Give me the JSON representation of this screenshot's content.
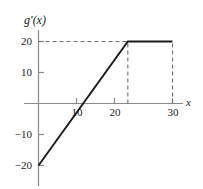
{
  "chart_data": {
    "type": "line",
    "title": "",
    "subtitle": "",
    "xlabel": "x",
    "ylabel": "g'(x)",
    "xlim": [
      0,
      33
    ],
    "ylim": [
      -22,
      22
    ],
    "grid": false,
    "legend": null,
    "x_ticks": [
      10,
      20,
      30
    ],
    "x_tick_labels": [
      "10",
      "20",
      "30"
    ],
    "y_ticks": [
      20,
      10,
      -10,
      -20
    ],
    "y_tick_labels": [
      "20",
      "10",
      "−10",
      "−20"
    ],
    "series": [
      {
        "name": "g'(x)",
        "style": "solid",
        "color": "#1a1a1a",
        "points": [
          {
            "x": 0,
            "y": -20
          },
          {
            "x": 20,
            "y": 20
          },
          {
            "x": 30,
            "y": 20
          }
        ]
      }
    ],
    "annotations": [
      {
        "kind": "dashed-horizontal",
        "y": 20,
        "x_from": 0,
        "x_to": 20
      },
      {
        "kind": "dashed-vertical",
        "x": 20,
        "y_from": 0,
        "y_to": 20
      },
      {
        "kind": "dashed-vertical",
        "x": 30,
        "y_from": 0,
        "y_to": 20
      }
    ],
    "zero_crossing": {
      "x": 10,
      "y": 0
    },
    "axis_color": "#8a8a8a",
    "curve_color": "#1a1a1a",
    "dash_color": "#6e6e6e"
  },
  "labels": {
    "y_axis_name": "g′(x)",
    "x_axis_name": "x",
    "y20": "20",
    "y10": "10",
    "ym10": "−10",
    "ym20": "−20",
    "x10": "10",
    "x20": "20",
    "x30": "30"
  }
}
